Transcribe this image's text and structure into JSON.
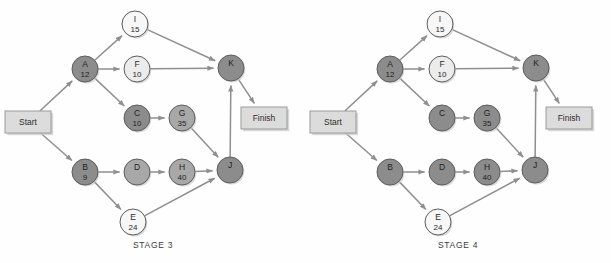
{
  "figure": {
    "panel_count": 2
  },
  "palette": {
    "node_dark": "#8c8c8c",
    "node_darker": "#8a8a8a",
    "node_medium": "#a8a8a8",
    "node_light": "#ececec",
    "node_white": "#f7f7f7",
    "node_stroke": "#5d5d5d",
    "edge": "#8f8f8f",
    "box_fill": "#dcdcdc",
    "box_stroke": "#9a9a9a",
    "text_dark": "#2a2a2a",
    "text_faint": "#7f7f7f",
    "shadow": "#c9c9c9",
    "page_bg": "#fefefe"
  },
  "geometry": {
    "node_radius": 13,
    "positions": {
      "Start": {
        "x": 28,
        "y": 122
      },
      "A": {
        "x": 85,
        "y": 69
      },
      "I": {
        "x": 135,
        "y": 24
      },
      "F": {
        "x": 137,
        "y": 69
      },
      "C": {
        "x": 137,
        "y": 118
      },
      "G": {
        "x": 182,
        "y": 118
      },
      "B": {
        "x": 85,
        "y": 172
      },
      "D": {
        "x": 137,
        "y": 172
      },
      "H": {
        "x": 182,
        "y": 172
      },
      "E": {
        "x": 133,
        "y": 222
      },
      "J": {
        "x": 230,
        "y": 170
      },
      "K": {
        "x": 231,
        "y": 68
      },
      "Finish": {
        "x": 264,
        "y": 118
      }
    },
    "box_size": {
      "w": 46,
      "h": 22
    }
  },
  "chart_data": {
    "type": "diagram",
    "diagram_kind": "activity-on-node project network (critical path analysis)",
    "panels": [
      {
        "id": "stage-3",
        "caption": "STAGE 3",
        "nodes": [
          {
            "id": "Start",
            "shape": "box",
            "label": "Start",
            "duration": "",
            "shade": "box"
          },
          {
            "id": "A",
            "shape": "circle",
            "label": "A",
            "duration": "12",
            "shade": "dark"
          },
          {
            "id": "I",
            "shape": "circle",
            "label": "I",
            "duration": "15",
            "shade": "white"
          },
          {
            "id": "F",
            "shape": "circle",
            "label": "F",
            "duration": "10",
            "shade": "light"
          },
          {
            "id": "C",
            "shape": "circle",
            "label": "C",
            "duration": "10",
            "shade": "dark"
          },
          {
            "id": "G",
            "shape": "circle",
            "label": "G",
            "duration": "35",
            "shade": "medium"
          },
          {
            "id": "B",
            "shape": "circle",
            "label": "B",
            "duration": "9",
            "shade": "dark"
          },
          {
            "id": "D",
            "shape": "circle",
            "label": "D",
            "duration": "",
            "shade": "medium"
          },
          {
            "id": "H",
            "shape": "circle",
            "label": "H",
            "duration": "40",
            "shade": "medium"
          },
          {
            "id": "E",
            "shape": "circle",
            "label": "E",
            "duration": "24",
            "shade": "white"
          },
          {
            "id": "J",
            "shape": "circle",
            "label": "J",
            "duration": "",
            "shade": "dark"
          },
          {
            "id": "K",
            "shape": "circle",
            "label": "K",
            "duration": "",
            "shade": "dark"
          },
          {
            "id": "Finish",
            "shape": "box",
            "label": "Finish",
            "duration": "",
            "shade": "box"
          }
        ],
        "edges": [
          {
            "from": "Start",
            "to": "A"
          },
          {
            "from": "Start",
            "to": "B"
          },
          {
            "from": "A",
            "to": "I"
          },
          {
            "from": "A",
            "to": "F"
          },
          {
            "from": "A",
            "to": "C"
          },
          {
            "from": "I",
            "to": "K"
          },
          {
            "from": "F",
            "to": "K"
          },
          {
            "from": "C",
            "to": "G"
          },
          {
            "from": "G",
            "to": "J"
          },
          {
            "from": "B",
            "to": "D"
          },
          {
            "from": "B",
            "to": "E"
          },
          {
            "from": "D",
            "to": "H"
          },
          {
            "from": "H",
            "to": "J"
          },
          {
            "from": "E",
            "to": "J"
          },
          {
            "from": "J",
            "to": "K"
          },
          {
            "from": "K",
            "to": "Finish"
          }
        ]
      },
      {
        "id": "stage-4",
        "caption": "STAGE 4",
        "nodes": [
          {
            "id": "Start",
            "shape": "box",
            "label": "Start",
            "duration": "",
            "shade": "box"
          },
          {
            "id": "A",
            "shape": "circle",
            "label": "A",
            "duration": "12",
            "shade": "dark"
          },
          {
            "id": "I",
            "shape": "circle",
            "label": "I",
            "duration": "15",
            "shade": "white"
          },
          {
            "id": "F",
            "shape": "circle",
            "label": "F",
            "duration": "10",
            "shade": "light"
          },
          {
            "id": "C",
            "shape": "circle",
            "label": "C",
            "duration": "",
            "shade": "dark"
          },
          {
            "id": "G",
            "shape": "circle",
            "label": "G",
            "duration": "35",
            "shade": "dark"
          },
          {
            "id": "B",
            "shape": "circle",
            "label": "B",
            "duration": "",
            "shade": "dark"
          },
          {
            "id": "D",
            "shape": "circle",
            "label": "D",
            "duration": "",
            "shade": "dark"
          },
          {
            "id": "H",
            "shape": "circle",
            "label": "H",
            "duration": "40",
            "shade": "dark"
          },
          {
            "id": "E",
            "shape": "circle",
            "label": "E",
            "duration": "24",
            "shade": "white"
          },
          {
            "id": "J",
            "shape": "circle",
            "label": "J",
            "duration": "",
            "shade": "dark"
          },
          {
            "id": "K",
            "shape": "circle",
            "label": "K",
            "duration": "",
            "shade": "dark"
          },
          {
            "id": "Finish",
            "shape": "box",
            "label": "Finish",
            "duration": "",
            "shade": "box"
          }
        ],
        "edges": [
          {
            "from": "Start",
            "to": "A"
          },
          {
            "from": "Start",
            "to": "B"
          },
          {
            "from": "A",
            "to": "I"
          },
          {
            "from": "A",
            "to": "F"
          },
          {
            "from": "A",
            "to": "C"
          },
          {
            "from": "I",
            "to": "K"
          },
          {
            "from": "F",
            "to": "K"
          },
          {
            "from": "C",
            "to": "G"
          },
          {
            "from": "G",
            "to": "J"
          },
          {
            "from": "B",
            "to": "D"
          },
          {
            "from": "B",
            "to": "E"
          },
          {
            "from": "D",
            "to": "H"
          },
          {
            "from": "H",
            "to": "J"
          },
          {
            "from": "E",
            "to": "J"
          },
          {
            "from": "J",
            "to": "K"
          },
          {
            "from": "K",
            "to": "Finish"
          }
        ]
      }
    ]
  }
}
